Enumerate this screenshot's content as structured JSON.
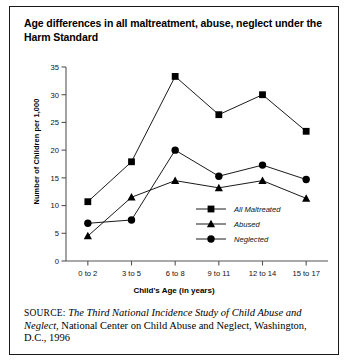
{
  "figure": {
    "title": "Age differences in all maltreatment, abuse, neglect under the Harm Standard",
    "source_prefix": "SOURCE:",
    "source_title": "The Third National Incidence Study of Child Abuse and Neglect",
    "source_rest": ", National Center on Child Abuse and Neglect, Washington, D.C., 1996"
  },
  "chart_data": {
    "type": "line",
    "title": "Age differences in all maltreatment, abuse, neglect under the Harm Standard",
    "xlabel": "Child's Age (in years)",
    "ylabel": "Number of Children per 1,000",
    "categories": [
      "0 to 2",
      "3 to 5",
      "6 to 8",
      "9 to 11",
      "12 to 14",
      "15 to 17"
    ],
    "ylim": [
      0,
      35
    ],
    "yticks": [
      0,
      5,
      10,
      15,
      20,
      25,
      30,
      35
    ],
    "grid": false,
    "legend_position": "inside-lower-right",
    "series": [
      {
        "name": "All Maltreated",
        "marker": "square",
        "color": "#000000",
        "values": [
          10.7,
          17.9,
          33.3,
          26.4,
          30.0,
          23.4
        ]
      },
      {
        "name": "Abused",
        "marker": "triangle",
        "color": "#000000",
        "values": [
          4.5,
          11.5,
          14.5,
          13.2,
          14.5,
          11.3
        ]
      },
      {
        "name": "Neglected",
        "marker": "circle",
        "color": "#000000",
        "values": [
          6.8,
          7.4,
          20.0,
          15.3,
          17.3,
          14.7
        ]
      }
    ]
  }
}
